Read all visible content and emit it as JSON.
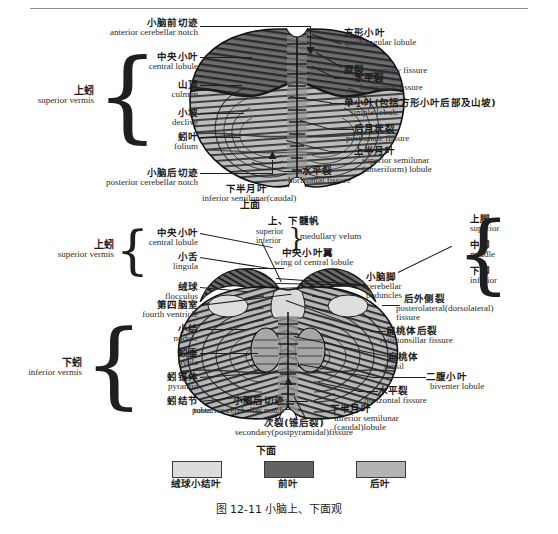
{
  "figure": {
    "caption": "图 12-11    小脑上、下面观",
    "top_view_name": "上面",
    "bottom_view_name": "下面"
  },
  "colors": {
    "flocculonodular": "#dcdcdc",
    "anterior_lobe": "#636363",
    "posterior_lobe": "#b4b4b4",
    "line": "#1f1f1f",
    "rule": "#8d8d8d"
  },
  "legend": {
    "items": [
      {
        "label": "绒球小结叶",
        "color": "#dcdcdc"
      },
      {
        "label": "前叶",
        "color": "#636363"
      },
      {
        "label": "后叶",
        "color": "#b4b4b4"
      }
    ]
  },
  "superior_view": {
    "group_label": {
      "cn": "上蚓",
      "en": "superior vermis"
    },
    "labels_left": [
      {
        "cn": "小脑前切迹",
        "en": "anterior cerebellar notch"
      },
      {
        "cn": "中央小叶",
        "en": "central lobule"
      },
      {
        "cn": "山顶",
        "en": "culmen"
      },
      {
        "cn": "小坡",
        "en": "declive"
      },
      {
        "cn": "蚓叶",
        "en": "folium"
      },
      {
        "cn": "小脑后切迹",
        "en": "posterior cerebellar notch"
      }
    ],
    "labels_right": [
      {
        "cn": "方形小叶",
        "en": "quadrangular lobule"
      },
      {
        "cn": "原裂",
        "en": "primary fissure"
      },
      {
        "cn": "水平裂",
        "en": "horizontal fissure"
      },
      {
        "cn": "单小叶(包括方形小叶后部及山坡)",
        "en": "simple lobule"
      },
      {
        "cn": "后月状裂",
        "en": "postlunate fissure"
      },
      {
        "cn": "上半月叶",
        "en": "superior semilunar",
        "en2": "(anseriform) lobule"
      },
      {
        "cn": "水平裂",
        "en": "horizontal fissure"
      },
      {
        "cn": "下半月叶",
        "en": "inferior semilunar(caudal)"
      }
    ]
  },
  "inferior_view": {
    "group_label_superior": {
      "cn": "上蚓",
      "en": "superior vermis"
    },
    "group_label_inferior": {
      "cn": "下蚓",
      "en": "inferior vermis"
    },
    "labels_left": [
      {
        "cn": "中央小叶",
        "en": "central lobule"
      },
      {
        "cn": "小舌",
        "en": "lingula"
      },
      {
        "cn": "绒球",
        "en": "flocculus"
      },
      {
        "cn": "第四脑室",
        "en": "fourth ventricle"
      },
      {
        "cn": "小结",
        "en": "nodule"
      },
      {
        "cn": "蚓垂",
        "en": "uvula"
      },
      {
        "cn": "蚓锥体",
        "en": "pyramid"
      },
      {
        "cn": "蚓结节",
        "en": "tuber"
      },
      {
        "cn": "小脑后切迹",
        "en": "posterior cerebellar notch"
      }
    ],
    "labels_center": [
      {
        "cn": "上、下髓帆",
        "en_a": "superior",
        "en_b": "inferior",
        "en": "medullary velum"
      },
      {
        "cn": "中央小叶翼",
        "en": "wing of central lobule"
      },
      {
        "cn": "小脑脚",
        "en": "cerebellar",
        "en2": "peduncles"
      },
      {
        "cn": "次裂(锥后裂)",
        "en": "secondary(postpyramidal)fissure"
      }
    ],
    "labels_right": [
      {
        "cn": "上脚",
        "en": "superior"
      },
      {
        "cn": "中脚",
        "en": "middle"
      },
      {
        "cn": "下脚",
        "en": "inferior"
      },
      {
        "cn": "后外侧裂",
        "en": "posterolateral(dorsolateral)",
        "en2": "fissure"
      },
      {
        "cn": "扁桃体后裂",
        "en": "retrotonsillar fissure"
      },
      {
        "cn": "扁桃体",
        "en": "tonsil"
      },
      {
        "cn": "二腹小叶",
        "en": "biventer lobule"
      },
      {
        "cn": "水平裂",
        "en": "horizontal fissure"
      },
      {
        "cn": "下半月叶",
        "en": "inferior semilunar",
        "en2": "(caudal)lobule"
      }
    ]
  }
}
